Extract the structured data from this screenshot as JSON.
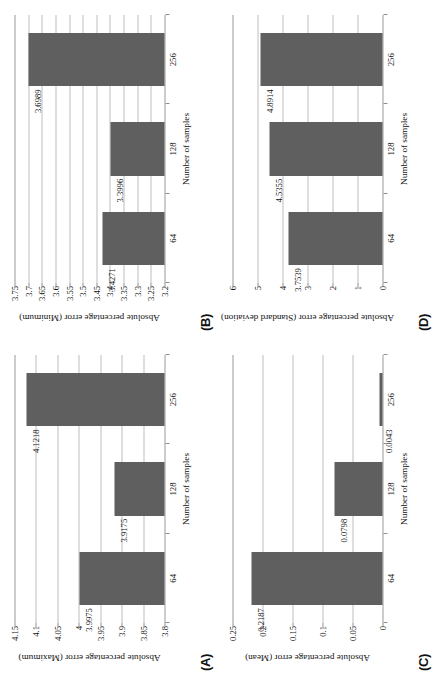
{
  "figure": {
    "caption_letters": [
      "(A)",
      "(B)",
      "(C)",
      "(D)"
    ],
    "shared_xlabel": "Number of samples",
    "categories": [
      "64",
      "128",
      "256"
    ],
    "bar_color": "#5f5f5f",
    "grid_color": "#bdbdbd",
    "axis_color": "#9a9a9a",
    "background": "#ffffff"
  },
  "chart_data": [
    {
      "panel": "(A)",
      "type": "bar",
      "title": "",
      "xlabel": "Number of samples",
      "ylabel": "Absolute percentage error (Maximum)",
      "categories": [
        "64",
        "128",
        "256"
      ],
      "values": [
        3.9975,
        3.9175,
        4.1218
      ],
      "value_labels": [
        "3.9975",
        "3.9175",
        "4.1218"
      ],
      "ylim": [
        3.8,
        4.15
      ],
      "yticks": [
        3.8,
        3.85,
        3.9,
        3.95,
        4,
        4.05,
        4.1,
        4.15
      ],
      "ytick_labels": [
        "3.8",
        "3.85",
        "3.9",
        "3.95",
        "4",
        "4.05",
        "4.1",
        "4.15"
      ],
      "grid": true,
      "legend": "none"
    },
    {
      "panel": "(B)",
      "type": "bar",
      "title": "",
      "xlabel": "Number of samples",
      "ylabel": "Absolute percentage error (Minimum)",
      "categories": [
        "64",
        "128",
        "256"
      ],
      "values": [
        3.4271,
        3.3996,
        3.6989
      ],
      "value_labels": [
        "3.4271",
        "3.3996",
        "3.6989"
      ],
      "ylim": [
        3.2,
        3.75
      ],
      "yticks": [
        3.2,
        3.25,
        3.3,
        3.35,
        3.4,
        3.45,
        3.5,
        3.55,
        3.6,
        3.65,
        3.7,
        3.75
      ],
      "ytick_labels": [
        "3.2",
        "3.25",
        "3.3",
        "3.35",
        "3.4",
        "3.45",
        "3.5",
        "3.55",
        "3.6",
        "3.65",
        "3.7",
        "3.75"
      ],
      "grid": true,
      "legend": "none"
    },
    {
      "panel": "(C)",
      "type": "bar",
      "title": "",
      "xlabel": "Number of samples",
      "ylabel": "Absolute percentage error (Mean)",
      "categories": [
        "64",
        "128",
        "256"
      ],
      "values": [
        0.2187,
        0.0798,
        0.0043
      ],
      "value_labels": [
        "0.2187",
        "0.0798",
        "0.0043"
      ],
      "ylim": [
        0,
        0.25
      ],
      "yticks": [
        0,
        0.05,
        0.1,
        0.15,
        0.2,
        0.25
      ],
      "ytick_labels": [
        "0",
        "0.05",
        "0.1",
        "0.15",
        "0.2",
        "0.25"
      ],
      "grid": true,
      "legend": "none"
    },
    {
      "panel": "(D)",
      "type": "bar",
      "title": "",
      "xlabel": "Number of samples",
      "ylabel": "Absolute percentage error (Standard deviation)",
      "categories": [
        "64",
        "128",
        "256"
      ],
      "values": [
        3.7539,
        4.5355,
        4.8914
      ],
      "value_labels": [
        "3.7539",
        "4.5355",
        "4.8914"
      ],
      "ylim": [
        0,
        6
      ],
      "yticks": [
        0,
        1,
        2,
        3,
        4,
        5,
        6
      ],
      "ytick_labels": [
        "0",
        "1",
        "2",
        "3",
        "4",
        "5",
        "6"
      ],
      "grid": true,
      "legend": "none"
    }
  ]
}
